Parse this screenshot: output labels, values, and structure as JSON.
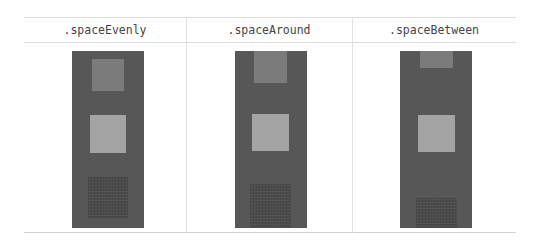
{
  "columns": [
    {
      "label": ".spaceEvenly",
      "mode": "spaceEvenly"
    },
    {
      "label": ".spaceAround",
      "mode": "spaceAround"
    },
    {
      "label": ".spaceBetween",
      "mode": "spaceBetween"
    }
  ],
  "colors": {
    "container": "#575757",
    "item_1": "#7b7b7b",
    "item_2": "#a4a4a4",
    "item_3": "#4b4b4b",
    "header_text": "#444444",
    "rule": "#dcdcdc"
  }
}
